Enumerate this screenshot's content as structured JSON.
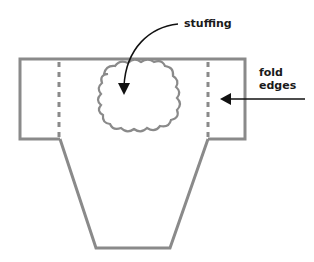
{
  "diagram": {
    "labels": {
      "stuffing": "stuffing",
      "fold_line1": "fold",
      "fold_line2": "edges"
    },
    "colors": {
      "outline": "#8a8a8a",
      "arrow": "#111111",
      "text": "#1a1a1a",
      "background": "#ffffff"
    },
    "shapes": {
      "rectangle": "top band with side flaps",
      "trapezoid": "tapering lower body",
      "cloud": "stuffing placement",
      "dashed_lines": 2
    }
  }
}
